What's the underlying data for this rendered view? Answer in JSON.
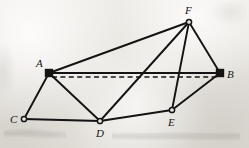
{
  "figure": {
    "type": "geometric-graph-diagram",
    "width": 249,
    "height": 148,
    "background_color": "#e9e7e2",
    "stroke_color": "#141414",
    "vertices": [
      {
        "id": "A",
        "label": "A",
        "x": 49,
        "y": 73,
        "marker": "filled-square",
        "label_dx": -13,
        "label_dy": -15
      },
      {
        "id": "B",
        "label": "B",
        "x": 220,
        "y": 73,
        "marker": "filled-square",
        "label_dx": 7,
        "label_dy": -4
      },
      {
        "id": "C",
        "label": "C",
        "x": 24,
        "y": 119,
        "marker": "open-circle",
        "label_dx": -14,
        "label_dy": -5
      },
      {
        "id": "D",
        "label": "D",
        "x": 100,
        "y": 121,
        "marker": "open-circle",
        "label_dx": -4,
        "label_dy": 7
      },
      {
        "id": "E",
        "label": "E",
        "x": 172,
        "y": 110,
        "marker": "open-circle",
        "label_dx": -4,
        "label_dy": 7
      },
      {
        "id": "F",
        "label": "F",
        "x": 189,
        "y": 22,
        "marker": "open-circle",
        "label_dx": -4,
        "label_dy": -17
      }
    ],
    "edges": [
      {
        "from": "A",
        "to": "F",
        "style": "solid"
      },
      {
        "from": "A",
        "to": "B",
        "style": "solid"
      },
      {
        "from": "A",
        "to": "C",
        "style": "solid"
      },
      {
        "from": "A",
        "to": "D",
        "style": "solid"
      },
      {
        "from": "C",
        "to": "D",
        "style": "solid"
      },
      {
        "from": "D",
        "to": "E",
        "style": "solid"
      },
      {
        "from": "D",
        "to": "F",
        "style": "solid"
      },
      {
        "from": "E",
        "to": "F",
        "style": "solid"
      },
      {
        "from": "E",
        "to": "B",
        "style": "solid"
      },
      {
        "from": "F",
        "to": "B",
        "style": "solid"
      }
    ],
    "dashed_edges": [
      {
        "from": "A",
        "to": "B",
        "style": "dashed",
        "offset_y": 4
      }
    ],
    "labels": {
      "A": "A",
      "B": "B",
      "C": "C",
      "D": "D",
      "E": "E",
      "F": "F"
    }
  }
}
